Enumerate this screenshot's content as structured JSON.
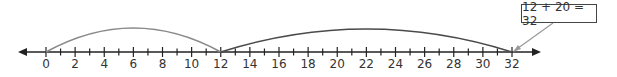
{
  "number_line": {
    "min": 0,
    "max": 32,
    "labels": [
      "0",
      "2",
      "4",
      "6",
      "8",
      "10",
      "12",
      "14",
      "16",
      "18",
      "20",
      "22",
      "24",
      "26",
      "28",
      "30",
      "32"
    ],
    "jumps": [
      {
        "from": 0,
        "to": 12,
        "color": "#8a8a8a"
      },
      {
        "from": 12,
        "to": 32,
        "color": "#4a4a4a"
      }
    ]
  },
  "callout": {
    "text": "12 + 20 = 32",
    "points_to": 32
  }
}
